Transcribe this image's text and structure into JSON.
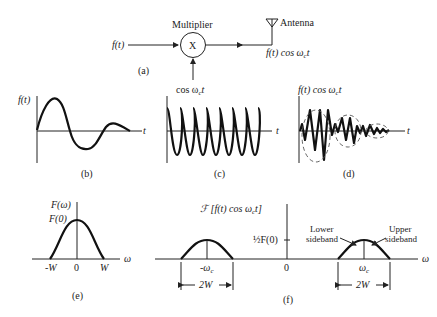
{
  "panel_a": {
    "caption": "(a)",
    "input_label": "f(t)",
    "multiplier_title": "Multiplier",
    "multiplier_symbol": "X",
    "carrier_label": "cos ω",
    "carrier_sub": "c",
    "carrier_t": "t",
    "antenna_label": "Antenna",
    "output_label": "f(t) cos ω",
    "output_sub": "c",
    "output_t": "t"
  },
  "panel_b": {
    "caption": "(b)",
    "y_label": "f(t)",
    "x_label": "t"
  },
  "panel_c": {
    "caption": "(c)",
    "x_label": "t"
  },
  "panel_d": {
    "caption": "(d)",
    "y_label": "f(t) cos ω",
    "y_sub": "c",
    "y_t": "t",
    "x_label": "t"
  },
  "panel_e": {
    "caption": "(e)",
    "y_label": "F(ω)",
    "peak_label": "F(0)",
    "ticks": [
      "-W",
      "0",
      "W"
    ],
    "x_label": "ω"
  },
  "panel_f": {
    "caption": "(f)",
    "y_label": "ℱ [f(t)  cos ω",
    "y_sub": "c",
    "y_t": "t]",
    "half_label": "½F(0)",
    "ticks": [
      "-ω",
      "0",
      "ω"
    ],
    "tick_sub": "c",
    "x_label": "ω",
    "lower_sideband": [
      "Lower",
      "sideband"
    ],
    "upper_sideband": [
      "Upper",
      "sideband"
    ],
    "bandwidth_label": "2W"
  }
}
